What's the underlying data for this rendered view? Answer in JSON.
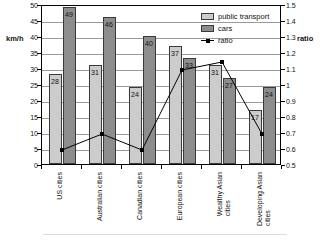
{
  "chart_data": {
    "type": "bar",
    "title": "",
    "subtitle": "",
    "xlabel": "",
    "ylabel": "km/h",
    "ylabel_right": "ratio",
    "ylim": [
      0,
      50
    ],
    "ylim_right": [
      0.5,
      1.5
    ],
    "grid": true,
    "legend_position": "top-right",
    "categories": [
      "US cities",
      "Australian cities",
      "Canadian cities",
      "European cities",
      "Wealthy Asian\ncities",
      "Developing Asian\ncities"
    ],
    "series": [
      {
        "name": "public transport",
        "axis": "left",
        "color": "#cccccc",
        "values": [
          28,
          31,
          24,
          37,
          31,
          17
        ]
      },
      {
        "name": "cars",
        "axis": "left",
        "color": "#8d8d8d",
        "values": [
          49,
          46,
          40,
          33,
          27,
          24
        ]
      },
      {
        "name": "ratio",
        "type": "line",
        "axis": "right",
        "color": "#000000",
        "values": [
          0.6,
          0.7,
          0.6,
          1.1,
          1.15,
          0.7
        ]
      }
    ],
    "yticks_left": [
      "0",
      "5",
      "10",
      "15",
      "20",
      "25",
      "30",
      "35",
      "40",
      "45",
      "50"
    ],
    "yticks_right": [
      "0.5",
      "0.6",
      "0.7",
      "0.8",
      "0.9",
      "1",
      "1.1",
      "1.2",
      "1.3",
      "1.4",
      "1.5"
    ]
  },
  "legend": {
    "items": [
      {
        "label": "public transport",
        "kind": "swatch-light"
      },
      {
        "label": "cars",
        "kind": "swatch-dark"
      },
      {
        "label": "ratio",
        "kind": "line-marker"
      }
    ]
  }
}
